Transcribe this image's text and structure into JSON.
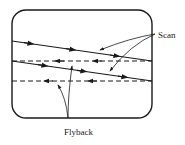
{
  "diagram": {
    "labels": {
      "scan": "Scan",
      "flyback": "Flyback"
    },
    "colors": {
      "stroke": "#1a1a1a",
      "background": "#ffffff"
    },
    "scan_lines": 2,
    "flyback_lines": 2
  }
}
